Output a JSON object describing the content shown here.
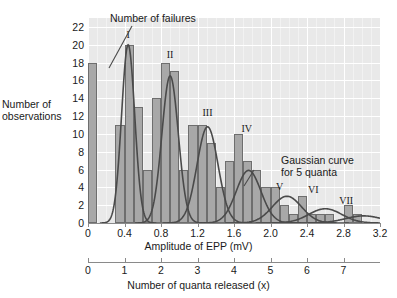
{
  "chart_data": {
    "type": "bar",
    "title": "",
    "xlabel": "Amplitude of EPP (mV)",
    "ylabel": "Number of observations",
    "secondary_xlabel": "Number of quanta released (x)",
    "xlim": [
      0,
      3.2
    ],
    "ylim": [
      0,
      23
    ],
    "secondary_xlim": [
      0,
      8
    ],
    "grid": true,
    "legend_position": "none",
    "bin_width": 0.1,
    "x_tick_labels": [
      "0",
      "0.4",
      "0.8",
      "1.2",
      "1.6",
      "2.0",
      "2.4",
      "2.8",
      "3.2"
    ],
    "x_tick_values": [
      0,
      0.4,
      0.8,
      1.2,
      1.6,
      2.0,
      2.4,
      2.8,
      3.2
    ],
    "y_tick_labels": [
      "0",
      "2",
      "4",
      "6",
      "8",
      "10",
      "12",
      "14",
      "16",
      "18",
      "20",
      "22"
    ],
    "y_tick_values": [
      0,
      2,
      4,
      6,
      8,
      10,
      12,
      14,
      16,
      18,
      20,
      22
    ],
    "secondary_x_tick_labels": [
      "0",
      "1",
      "2",
      "3",
      "4",
      "5",
      "6",
      "7"
    ],
    "secondary_x_tick_values": [
      0,
      1,
      2,
      3,
      4,
      5,
      6,
      7
    ],
    "bins": [
      {
        "x0": 0.0,
        "x1": 0.1,
        "value": 18
      },
      {
        "x0": 0.1,
        "x1": 0.2,
        "value": 0
      },
      {
        "x0": 0.2,
        "x1": 0.3,
        "value": 0
      },
      {
        "x0": 0.3,
        "x1": 0.4,
        "value": 11
      },
      {
        "x0": 0.4,
        "x1": 0.5,
        "value": 20
      },
      {
        "x0": 0.5,
        "x1": 0.6,
        "value": 13
      },
      {
        "x0": 0.6,
        "x1": 0.7,
        "value": 6
      },
      {
        "x0": 0.7,
        "x1": 0.8,
        "value": 14
      },
      {
        "x0": 0.8,
        "x1": 0.9,
        "value": 18
      },
      {
        "x0": 0.9,
        "x1": 1.0,
        "value": 17
      },
      {
        "x0": 1.0,
        "x1": 1.1,
        "value": 6
      },
      {
        "x0": 1.1,
        "x1": 1.2,
        "value": 11
      },
      {
        "x0": 1.2,
        "x1": 1.3,
        "value": 11
      },
      {
        "x0": 1.3,
        "x1": 1.4,
        "value": 9
      },
      {
        "x0": 1.4,
        "x1": 1.5,
        "value": 4
      },
      {
        "x0": 1.5,
        "x1": 1.6,
        "value": 7
      },
      {
        "x0": 1.6,
        "x1": 1.7,
        "value": 10
      },
      {
        "x0": 1.7,
        "x1": 1.8,
        "value": 7
      },
      {
        "x0": 1.8,
        "x1": 1.9,
        "value": 6
      },
      {
        "x0": 1.9,
        "x1": 2.0,
        "value": 4
      },
      {
        "x0": 2.0,
        "x1": 2.1,
        "value": 4
      },
      {
        "x0": 2.1,
        "x1": 2.2,
        "value": 2
      },
      {
        "x0": 2.2,
        "x1": 2.3,
        "value": 1
      },
      {
        "x0": 2.3,
        "x1": 2.4,
        "value": 3
      },
      {
        "x0": 2.4,
        "x1": 2.5,
        "value": 1
      },
      {
        "x0": 2.5,
        "x1": 2.6,
        "value": 1
      },
      {
        "x0": 2.6,
        "x1": 2.7,
        "value": 1
      },
      {
        "x0": 2.7,
        "x1": 2.8,
        "value": 0
      },
      {
        "x0": 2.8,
        "x1": 2.9,
        "value": 2
      },
      {
        "x0": 2.9,
        "x1": 3.0,
        "value": 1
      },
      {
        "x0": 3.0,
        "x1": 3.1,
        "value": 0
      },
      {
        "x0": 3.1,
        "x1": 3.2,
        "value": 0
      }
    ],
    "gaussian_curves": [
      {
        "label": "I",
        "mean": 0.44,
        "sigma": 0.072,
        "peak": 20.0
      },
      {
        "label": "II",
        "mean": 0.9,
        "sigma": 0.09,
        "peak": 16.5
      },
      {
        "label": "III",
        "mean": 1.31,
        "sigma": 0.115,
        "peak": 10.8
      },
      {
        "label": "IV",
        "mean": 1.76,
        "sigma": 0.135,
        "peak": 5.9
      },
      {
        "label": "V",
        "mean": 2.18,
        "sigma": 0.16,
        "peak": 3.0
      },
      {
        "label": "VI",
        "mean": 2.6,
        "sigma": 0.18,
        "peak": 1.6
      },
      {
        "label": "VII",
        "mean": 3.02,
        "sigma": 0.2,
        "peak": 0.8
      }
    ],
    "peak_labels": [
      {
        "text": "I",
        "x": 0.44,
        "y": 21.6
      },
      {
        "text": "II",
        "x": 0.9,
        "y": 19.4
      },
      {
        "text": "III",
        "x": 1.31,
        "y": 12.9
      },
      {
        "text": "IV",
        "x": 1.74,
        "y": 11.1
      },
      {
        "text": "V",
        "x": 2.1,
        "y": 4.6
      },
      {
        "text": "VI",
        "x": 2.47,
        "y": 4.3
      },
      {
        "text": "VII",
        "x": 2.83,
        "y": 3.0
      }
    ],
    "annotations": [
      {
        "name": "failures-annotation",
        "text": "Number of failures"
      },
      {
        "name": "gaussian-annotation",
        "text": "Gaussian curve\nfor 5 quanta"
      }
    ],
    "colors": {
      "plot_background": "#e9e9e9",
      "gridline": "#ffffff",
      "bar_fill": "#a8a8a8",
      "bar_stroke": "#6e6e6e",
      "curve_stroke": "#4a4a4a",
      "axis": "#8a8a8a",
      "text": "#1a1a1a"
    }
  }
}
